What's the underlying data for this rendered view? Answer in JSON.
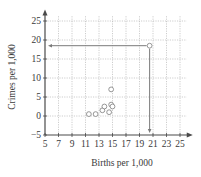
{
  "chart_data": {
    "type": "scatter",
    "title": "",
    "xlabel": "Births per 1,000",
    "ylabel": "Crimes per 1,000",
    "xlim": [
      5,
      26
    ],
    "ylim": [
      -5,
      27
    ],
    "xticks": [
      5,
      7,
      9,
      11,
      13,
      15,
      17,
      19,
      21,
      23,
      25
    ],
    "yticks": [
      -5,
      0,
      5,
      10,
      15,
      20,
      25
    ],
    "grid": true,
    "legend": "none",
    "points": [
      {
        "x": 11.5,
        "y": 0.5
      },
      {
        "x": 12.5,
        "y": 0.5
      },
      {
        "x": 13.5,
        "y": 1.5
      },
      {
        "x": 13.8,
        "y": 2.5
      },
      {
        "x": 14.5,
        "y": 1.0
      },
      {
        "x": 14.8,
        "y": 3.0
      },
      {
        "x": 15.0,
        "y": 2.5
      },
      {
        "x": 14.8,
        "y": 7.0
      },
      {
        "x": 20.5,
        "y": 18.5
      }
    ],
    "annotations": [
      {
        "type": "arrow",
        "from": [
          20.5,
          18.5
        ],
        "to": [
          5,
          18.5
        ],
        "description": "horizontal arrow to y-axis"
      },
      {
        "type": "arrow",
        "from": [
          20.5,
          18.5
        ],
        "to": [
          20.5,
          -5
        ],
        "description": "vertical arrow to x-axis"
      }
    ]
  },
  "labels": {
    "xlabel": "Births per 1,000",
    "ylabel": "Crimes per 1,000",
    "xticks": [
      "5",
      "7",
      "9",
      "11",
      "13",
      "15",
      "17",
      "19",
      "21",
      "23",
      "25"
    ],
    "yticks": [
      "25",
      "20",
      "15",
      "10",
      "5",
      "0",
      "−5"
    ]
  }
}
